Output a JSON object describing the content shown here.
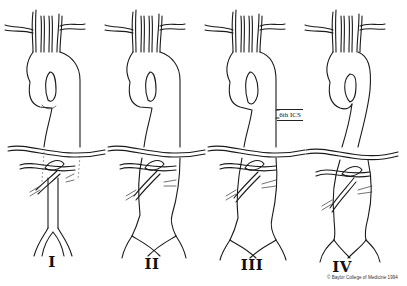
{
  "figure": {
    "panels": [
      {
        "id": "I",
        "label": "I",
        "center_x": 52
      },
      {
        "id": "II",
        "label": "II",
        "center_x": 152
      },
      {
        "id": "III",
        "label": "III",
        "center_x": 252
      },
      {
        "id": "IV",
        "label": "IV",
        "center_x": 342
      }
    ],
    "annotation": {
      "text": "6th ICS",
      "panel": "III"
    },
    "copyright": "© Baylor College of Medicine 1994",
    "colors": {
      "line": "#1a1a1a",
      "background": "#ffffff"
    }
  }
}
